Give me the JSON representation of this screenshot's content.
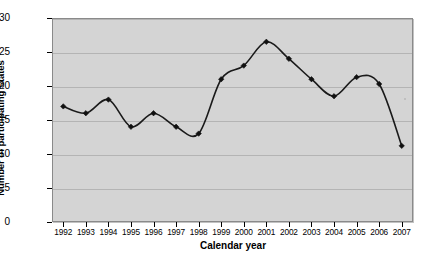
{
  "chart_data": {
    "type": "line",
    "title": "",
    "subtitle": "",
    "xlabel": "Calendar year",
    "ylabel": "Number of participating States",
    "x": [
      1992,
      1993,
      1994,
      1995,
      1996,
      1997,
      1998,
      1999,
      2000,
      2001,
      2002,
      2003,
      2004,
      2005,
      2006,
      2007
    ],
    "categories": [
      "1992",
      "1993",
      "1994",
      "1995",
      "1996",
      "1997",
      "1998",
      "1999",
      "2000",
      "2001",
      "2002",
      "2003",
      "2004",
      "2005",
      "2006",
      "2007"
    ],
    "values": [
      17,
      16,
      18,
      14,
      16,
      14,
      13,
      21,
      23,
      26.5,
      24,
      21,
      18.5,
      21.3,
      20.3,
      11.2
    ],
    "series": [
      {
        "name": "Participating States",
        "values": [
          17,
          16,
          18,
          14,
          16,
          14,
          13,
          21,
          23,
          26.5,
          24,
          21,
          18.5,
          21.3,
          20.3,
          11.2
        ]
      }
    ],
    "ylim": [
      0,
      30
    ],
    "yticks": [
      0,
      5,
      10,
      15,
      20,
      25,
      30
    ],
    "ytick_labels": [
      "0",
      "5",
      "10",
      "15",
      "20",
      "25",
      "30"
    ],
    "xlim": [
      1992,
      2007
    ],
    "grid": "horizontal",
    "legend": "none",
    "marker": "diamond",
    "line_color": "#1a1a1a",
    "marker_color": "#111111",
    "plot_background": "#d4d4d4",
    "gridline_color": "#b4b4b4",
    "figure_background": "#ffffff"
  }
}
